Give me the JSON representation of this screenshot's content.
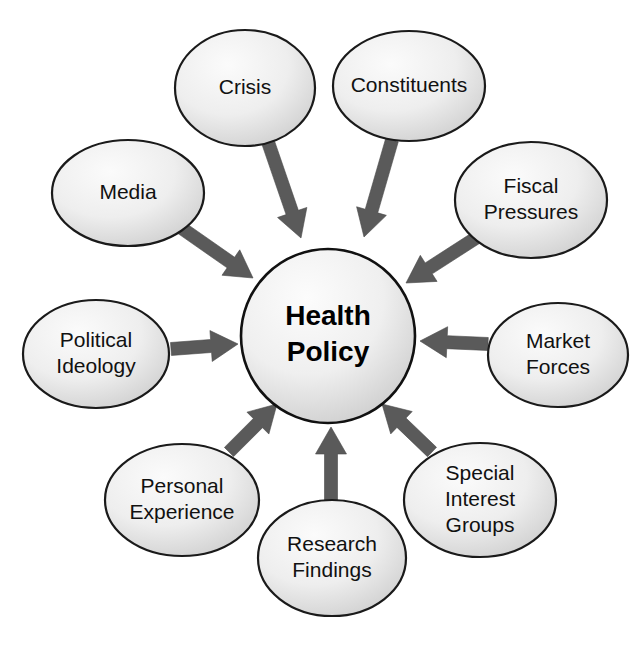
{
  "diagram": {
    "type": "hub-and-spoke",
    "background_color": "#ffffff",
    "node_fill_light": "#f4f4f4",
    "node_fill_dark": "#cccccc",
    "node_stroke_color": "#1a1a1a",
    "arrow_color": "#5a5a5a",
    "center": {
      "label_line1": "Health",
      "label_line2": "Policy",
      "cx": 328,
      "cy": 336,
      "r": 87
    },
    "nodes": [
      {
        "id": "crisis",
        "lines": [
          "Crisis"
        ],
        "cx": 245,
        "cy": 88,
        "rx": 70,
        "ry": 58,
        "arrow": {
          "x1": 268,
          "y1": 142,
          "x2": 301,
          "y2": 238
        }
      },
      {
        "id": "constituents",
        "lines": [
          "Constituents"
        ],
        "cx": 409,
        "cy": 86,
        "rx": 76,
        "ry": 55,
        "arrow": {
          "x1": 392,
          "y1": 140,
          "x2": 364,
          "y2": 237
        }
      },
      {
        "id": "media",
        "lines": [
          "Media"
        ],
        "cx": 128,
        "cy": 193,
        "rx": 76,
        "ry": 53,
        "arrow": {
          "x1": 180,
          "y1": 227,
          "x2": 253,
          "y2": 278
        }
      },
      {
        "id": "fiscal-pressures",
        "lines": [
          "Fiscal",
          "Pressures"
        ],
        "cx": 531,
        "cy": 200,
        "rx": 76,
        "ry": 58,
        "arrow": {
          "x1": 479,
          "y1": 236,
          "x2": 406,
          "y2": 283
        }
      },
      {
        "id": "political-ideology",
        "lines": [
          "Political",
          "Ideology"
        ],
        "cx": 96,
        "cy": 354,
        "rx": 73,
        "ry": 54,
        "arrow": {
          "x1": 171,
          "y1": 349,
          "x2": 238,
          "y2": 344
        }
      },
      {
        "id": "market-forces",
        "lines": [
          "Market",
          "Forces"
        ],
        "cx": 558,
        "cy": 355,
        "rx": 70,
        "ry": 52,
        "arrow": {
          "x1": 488,
          "y1": 344,
          "x2": 420,
          "y2": 341
        }
      },
      {
        "id": "personal-experience",
        "lines": [
          "Personal",
          "Experience"
        ],
        "cx": 182,
        "cy": 500,
        "rx": 77,
        "ry": 56,
        "arrow": {
          "x1": 229,
          "y1": 452,
          "x2": 277,
          "y2": 404
        }
      },
      {
        "id": "research-findings",
        "lines": [
          "Research",
          "Findings"
        ],
        "cx": 332,
        "cy": 558,
        "rx": 74,
        "ry": 58,
        "arrow": {
          "x1": 331,
          "y1": 500,
          "x2": 331,
          "y2": 427
        }
      },
      {
        "id": "special-interest-groups",
        "lines": [
          "Special",
          "Interest",
          "Groups"
        ],
        "cx": 480,
        "cy": 500,
        "rx": 76,
        "ry": 57,
        "arrow": {
          "x1": 432,
          "y1": 452,
          "x2": 382,
          "y2": 404
        }
      }
    ]
  }
}
